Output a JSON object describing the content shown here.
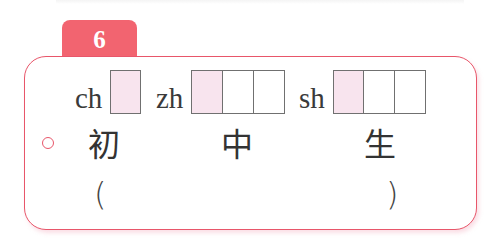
{
  "exercise": {
    "number": "6",
    "accent_color": "#f26470",
    "border_color": "#e8566a",
    "shaded_box_color": "#f8e4ee"
  },
  "pinyin_groups": [
    {
      "initial": "ch",
      "box_count": 1,
      "shaded_first": true
    },
    {
      "initial": "zh",
      "box_count": 3,
      "shaded_first": true
    },
    {
      "initial": "sh",
      "box_count": 3,
      "shaded_first": true
    }
  ],
  "characters": [
    "初",
    "中",
    "生"
  ],
  "answer_blank": {
    "open": "(",
    "close": ")"
  },
  "bullet_icon": "circle-bullet"
}
